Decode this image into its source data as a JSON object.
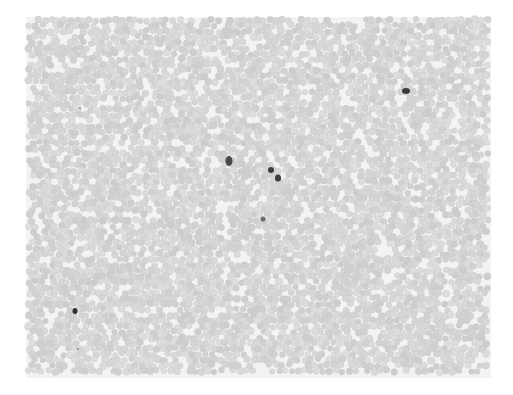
{
  "image": {
    "description": "Grayscale light-microscopy image of a peripheral blood smear: dense field of red blood cells with a few dark-staining white blood cells",
    "background_color": "#ffffff",
    "field": {
      "x": 26,
      "y": 17,
      "width": 465,
      "height": 361,
      "color": "#f3f3f3"
    },
    "rbc": {
      "color": "#d4d4d4",
      "edge_color": "#c6c6c6",
      "radius": 3.2,
      "spacing": 6.4,
      "seed": 7
    },
    "wbc": [
      {
        "label": "leukocyte-1",
        "x": 229,
        "y": 161,
        "w": 7,
        "h": 10,
        "color": "#4a4a4a"
      },
      {
        "label": "leukocyte-2",
        "x": 271,
        "y": 170,
        "w": 6,
        "h": 6,
        "color": "#3c3c3c"
      },
      {
        "label": "leukocyte-3",
        "x": 278,
        "y": 178,
        "w": 6,
        "h": 7,
        "color": "#3c3c3c"
      },
      {
        "label": "leukocyte-4",
        "x": 406,
        "y": 91,
        "w": 8,
        "h": 6,
        "color": "#3a3a3a"
      },
      {
        "label": "leukocyte-5",
        "x": 75,
        "y": 311,
        "w": 5,
        "h": 6,
        "color": "#2f2f2f"
      },
      {
        "label": "lymphocyte-small",
        "x": 263,
        "y": 219,
        "w": 5,
        "h": 5,
        "color": "#6a6a6a"
      },
      {
        "label": "speck-1",
        "x": 80,
        "y": 108,
        "w": 2,
        "h": 2,
        "color": "#8a8a8a"
      },
      {
        "label": "speck-2",
        "x": 78,
        "y": 349,
        "w": 2,
        "h": 2,
        "color": "#8a8a8a"
      }
    ]
  }
}
